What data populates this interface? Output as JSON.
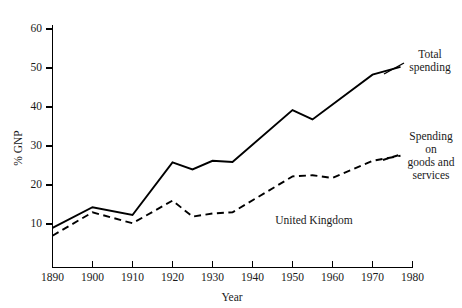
{
  "chart_data": {
    "type": "line",
    "title": "",
    "subtitle": "",
    "xlabel": "Year",
    "ylabel": "% GNP",
    "xlim": [
      1890,
      1980
    ],
    "ylim": [
      0,
      60
    ],
    "grid": false,
    "legend_position": "inline-annotations",
    "region_label": "United Kingdom",
    "xticks": [
      "1890",
      "1900",
      "1910",
      "1920",
      "1930",
      "1940",
      "1950",
      "1960",
      "1970",
      "1980"
    ],
    "xtick_values": [
      1890,
      1900,
      1910,
      1920,
      1930,
      1940,
      1950,
      1960,
      1970,
      1980
    ],
    "yticks": [
      "10",
      "20",
      "30",
      "40",
      "50",
      "60"
    ],
    "ytick_values": [
      10,
      20,
      30,
      40,
      50,
      60
    ],
    "series": [
      {
        "name": "Total spending",
        "style": "solid",
        "color": "#000000",
        "x": [
          1890,
          1900,
          1910,
          1920,
          1925,
          1930,
          1935,
          1950,
          1955,
          1970,
          1977
        ],
        "values": [
          9.0,
          14.3,
          12.3,
          25.8,
          24.0,
          26.2,
          25.9,
          39.2,
          36.8,
          48.3,
          50.3
        ],
        "annotation": [
          "Total",
          "spending"
        ]
      },
      {
        "name": "Spending on goods and services",
        "style": "dashed",
        "color": "#000000",
        "x": [
          1890,
          1900,
          1910,
          1920,
          1925,
          1930,
          1935,
          1950,
          1955,
          1960,
          1970,
          1977
        ],
        "values": [
          7.0,
          13.0,
          10.2,
          16.0,
          11.9,
          12.7,
          13.0,
          22.2,
          22.5,
          21.8,
          26.2,
          27.5
        ],
        "annotation": [
          "Spending",
          "on",
          "goods and",
          "services"
        ]
      }
    ]
  },
  "axes": {
    "y_title": "% GNP",
    "x_title": "Year",
    "y_tick_labels": [
      "60",
      "50",
      "40",
      "30",
      "20",
      "10"
    ],
    "x_tick_labels": [
      "1890",
      "1900",
      "1910",
      "1920",
      "1930",
      "1940",
      "1950",
      "1960",
      "1970",
      "1980"
    ]
  },
  "annotations": {
    "total_spending": {
      "line1": "Total",
      "line2": "spending"
    },
    "goods_services": {
      "line1": "Spending",
      "line2": "on",
      "line3": "goods and",
      "line4": "services"
    },
    "country": "United Kingdom"
  }
}
